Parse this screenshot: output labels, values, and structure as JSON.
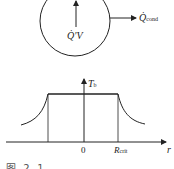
{
  "diagram": {
    "top": {
      "heat_generation_label": "Q̇′V",
      "conduction_label_main": "Q̇",
      "conduction_label_sub": "cond"
    },
    "bottom": {
      "y_axis_label_main": "T",
      "y_axis_label_sub": "b",
      "origin_label": "0",
      "radius_label_main": "R",
      "radius_label_sub": "crit",
      "x_axis_label": "r"
    },
    "caption": "图 2-1  ……"
  },
  "colors": {
    "line": "#222222",
    "background": "#ffffff"
  }
}
